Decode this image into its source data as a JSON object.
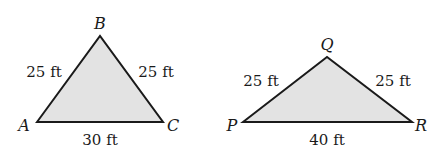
{
  "figure": {
    "fill_color": "#e3e3e3",
    "stroke_color": "#1a1a1a",
    "triangles": [
      {
        "name": "ABC",
        "vertices": {
          "A": "A",
          "B": "B",
          "C": "C"
        },
        "sides": {
          "AB": "25 ft",
          "BC": "25 ft",
          "AC": "30 ft"
        }
      },
      {
        "name": "PQR",
        "vertices": {
          "P": "P",
          "Q": "Q",
          "R": "R"
        },
        "sides": {
          "PQ": "25 ft",
          "QR": "25 ft",
          "PR": "40 ft"
        }
      }
    ]
  }
}
